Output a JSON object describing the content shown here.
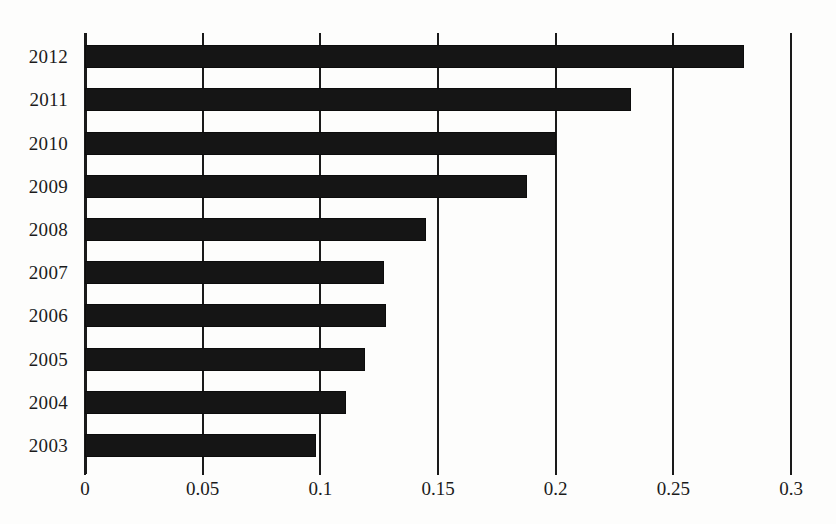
{
  "chart_data": {
    "type": "bar",
    "orientation": "horizontal",
    "title": "",
    "caption": "",
    "xlabel": "",
    "ylabel": "",
    "categories": [
      "2012",
      "2011",
      "2010",
      "2009",
      "2008",
      "2007",
      "2006",
      "2005",
      "2004",
      "2003"
    ],
    "values": [
      0.28,
      0.232,
      0.2,
      0.188,
      0.145,
      0.127,
      0.128,
      0.119,
      0.111,
      0.098
    ],
    "series": [
      {
        "name": "value",
        "values": [
          0.28,
          0.232,
          0.2,
          0.188,
          0.145,
          0.127,
          0.128,
          0.119,
          0.111,
          0.098
        ]
      }
    ],
    "xlim": [
      0,
      0.3
    ],
    "xticks": [
      0,
      0.05,
      0.1,
      0.15,
      0.2,
      0.25,
      0.3
    ],
    "xtick_labels": [
      "0",
      "0.05",
      "0.1",
      "0.15",
      "0.2",
      "0.25",
      "0.3"
    ],
    "ytick_labels": [
      "2012",
      "2011",
      "2010",
      "2009",
      "2008",
      "2007",
      "2006",
      "2005",
      "2004",
      "2003"
    ],
    "grid": true,
    "grid_axis": "x",
    "legend": false,
    "legend_position": "none",
    "bar_color": "#151515",
    "grid_color": "#1a1a1a",
    "background_color": "#fdfdfc"
  }
}
